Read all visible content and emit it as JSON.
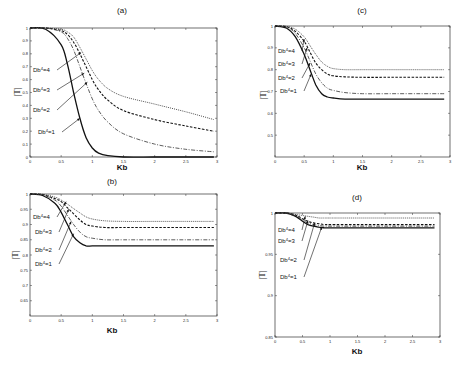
{
  "chart_data": [
    {
      "panel": "(a)",
      "type": "line",
      "title": "(a)",
      "xlabel": "Kb",
      "ylabel": "|T|",
      "xlim": [
        0,
        3
      ],
      "ylim": [
        0,
        1
      ],
      "xticks": [
        "0",
        "0.5",
        "1",
        "1.5",
        "2",
        "2.5",
        "3"
      ],
      "yticks": [
        "0",
        "0.1",
        "0.2",
        "0.3",
        "0.4",
        "0.5",
        "0.6",
        "0.7",
        "0.8",
        "0.9",
        "1"
      ],
      "grid": false,
      "x": [
        0,
        0.25,
        0.5,
        0.6,
        0.7,
        0.8,
        0.9,
        1.0,
        1.1,
        1.25,
        1.5,
        2.0,
        2.5,
        2.95
      ],
      "series": [
        {
          "name": "Db^4=1",
          "style": "solid",
          "values": [
            1,
            0.99,
            0.87,
            0.72,
            0.5,
            0.3,
            0.15,
            0.07,
            0.03,
            0.01,
            0,
            0,
            0,
            0
          ]
        },
        {
          "name": "Db^4=2",
          "style": "dashdot",
          "values": [
            1,
            1,
            0.97,
            0.92,
            0.83,
            0.7,
            0.57,
            0.45,
            0.36,
            0.27,
            0.18,
            0.1,
            0.06,
            0.04
          ]
        },
        {
          "name": "Db^4=3",
          "style": "dashed",
          "values": [
            1,
            1,
            0.98,
            0.95,
            0.89,
            0.8,
            0.7,
            0.6,
            0.52,
            0.44,
            0.36,
            0.29,
            0.24,
            0.2
          ]
        },
        {
          "name": "Db^4=4",
          "style": "dotted",
          "values": [
            1,
            1,
            0.99,
            0.97,
            0.93,
            0.85,
            0.76,
            0.67,
            0.6,
            0.53,
            0.47,
            0.41,
            0.35,
            0.29
          ]
        }
      ],
      "annotations": [
        "Db^4=4",
        "Db^4=3",
        "Db^4=2",
        "Db^4=1"
      ]
    },
    {
      "panel": "(b)",
      "type": "line",
      "title": "(b)",
      "xlabel": "Kb",
      "ylabel": "|T|",
      "xlim": [
        0,
        3
      ],
      "ylim": [
        0.6,
        1
      ],
      "xticks": [
        "0",
        "0.5",
        "1",
        "1.5",
        "2",
        "2.5",
        "3"
      ],
      "yticks": [
        "0.65",
        "0.7",
        "0.75",
        "0.8",
        "0.85",
        "0.9",
        "0.95",
        "1"
      ],
      "grid": false,
      "x": [
        0,
        0.2,
        0.4,
        0.5,
        0.6,
        0.7,
        0.8,
        0.9,
        1.0,
        1.2,
        1.5,
        2.0,
        2.5,
        2.95
      ],
      "series": [
        {
          "name": "Db^4=1",
          "style": "solid",
          "values": [
            1,
            0.995,
            0.97,
            0.94,
            0.9,
            0.86,
            0.84,
            0.83,
            0.83,
            0.83,
            0.83,
            0.83,
            0.83,
            0.83
          ]
        },
        {
          "name": "Db^4=2",
          "style": "dashdot",
          "values": [
            1,
            0.997,
            0.98,
            0.96,
            0.93,
            0.9,
            0.875,
            0.86,
            0.855,
            0.85,
            0.85,
            0.85,
            0.85,
            0.85
          ]
        },
        {
          "name": "Db^4=3",
          "style": "dashed",
          "values": [
            1,
            0.998,
            0.985,
            0.975,
            0.955,
            0.935,
            0.915,
            0.9,
            0.895,
            0.89,
            0.89,
            0.89,
            0.89,
            0.89
          ]
        },
        {
          "name": "Db^4=4",
          "style": "dotted",
          "values": [
            1,
            0.999,
            0.99,
            0.98,
            0.967,
            0.952,
            0.938,
            0.925,
            0.918,
            0.912,
            0.91,
            0.91,
            0.91,
            0.91
          ]
        }
      ],
      "annotations": [
        "Db^4=4",
        "Db^4=3",
        "Db^4=2",
        "Db^4=1"
      ]
    },
    {
      "panel": "(c)",
      "type": "line",
      "title": "(c)",
      "xlabel": "Kb",
      "ylabel": "|T|",
      "xlim": [
        0,
        3
      ],
      "ylim": [
        0.4,
        1
      ],
      "xticks": [
        "0",
        "0.5",
        "1",
        "1.5",
        "2",
        "2.5",
        "3"
      ],
      "yticks": [
        "0.5",
        "0.6",
        "0.7",
        "0.8",
        "0.9",
        "1"
      ],
      "grid": false,
      "x": [
        0,
        0.2,
        0.35,
        0.5,
        0.6,
        0.7,
        0.8,
        0.9,
        1.0,
        1.2,
        1.5,
        2.0,
        2.5,
        2.9
      ],
      "series": [
        {
          "name": "Db^4=1",
          "style": "solid",
          "values": [
            1,
            0.99,
            0.95,
            0.87,
            0.8,
            0.73,
            0.69,
            0.675,
            0.67,
            0.665,
            0.665,
            0.665,
            0.665,
            0.665
          ]
        },
        {
          "name": "Db^4=2",
          "style": "dashdot",
          "values": [
            1,
            0.995,
            0.965,
            0.9,
            0.84,
            0.78,
            0.74,
            0.715,
            0.705,
            0.695,
            0.69,
            0.69,
            0.69,
            0.69
          ]
        },
        {
          "name": "Db^4=3",
          "style": "dashed",
          "values": [
            1,
            0.997,
            0.975,
            0.93,
            0.88,
            0.83,
            0.8,
            0.78,
            0.772,
            0.767,
            0.765,
            0.765,
            0.765,
            0.765
          ]
        },
        {
          "name": "Db^4=4",
          "style": "dotted",
          "values": [
            1,
            0.998,
            0.985,
            0.95,
            0.91,
            0.87,
            0.835,
            0.815,
            0.805,
            0.8,
            0.8,
            0.8,
            0.8,
            0.8
          ]
        }
      ],
      "annotations": [
        "Db^4=4",
        "Db^4=3",
        "Db^4=2",
        "Db^4=1"
      ]
    },
    {
      "panel": "(d)",
      "type": "line",
      "title": "(d)",
      "xlabel": "Kb",
      "ylabel": "|T|",
      "xlim": [
        0,
        3
      ],
      "ylim": [
        0.85,
        1
      ],
      "xticks": [
        "0",
        "0.5",
        "1",
        "1.5",
        "2",
        "2.5",
        "3"
      ],
      "yticks": [
        "0.85",
        "0.9",
        "0.95",
        "1"
      ],
      "grid": false,
      "x": [
        0,
        0.2,
        0.3,
        0.4,
        0.5,
        0.6,
        0.7,
        0.8,
        0.9,
        1.0,
        1.5,
        2.0,
        2.5,
        2.9
      ],
      "series": [
        {
          "name": "Db^4=1",
          "style": "solid",
          "values": [
            1,
            1,
            0.998,
            0.995,
            0.99,
            0.986,
            0.984,
            0.983,
            0.982,
            0.982,
            0.982,
            0.982,
            0.982,
            0.982
          ]
        },
        {
          "name": "Db^4=2",
          "style": "dashdot",
          "values": [
            1,
            1,
            0.998,
            0.996,
            0.991,
            0.988,
            0.986,
            0.985,
            0.984,
            0.984,
            0.984,
            0.984,
            0.984,
            0.984
          ]
        },
        {
          "name": "Db^4=3",
          "style": "dashed",
          "values": [
            1,
            1,
            0.999,
            0.997,
            0.993,
            0.99,
            0.988,
            0.987,
            0.986,
            0.986,
            0.986,
            0.986,
            0.986,
            0.986
          ]
        },
        {
          "name": "Db^4=4",
          "style": "dotted",
          "values": [
            1,
            1,
            0.999,
            0.998,
            0.997,
            0.996,
            0.995,
            0.994,
            0.994,
            0.994,
            0.994,
            0.994,
            0.994,
            0.994
          ]
        }
      ],
      "annotations": [
        "Db^4=4",
        "Db^4=3",
        "Db^4=2",
        "Db^4=1"
      ]
    }
  ],
  "layout": {
    "panels": [
      {
        "id": "a",
        "box": [
          30,
          28,
          217,
          157
        ],
        "title_pos": [
          122,
          13
        ],
        "xlabel_pos": [
          122,
          170
        ],
        "ylabel_pos": [
          20,
          92
        ],
        "ann_pos": [
          [
            33,
            72
          ],
          [
            33,
            92
          ],
          [
            33,
            112
          ],
          [
            38,
            134
          ]
        ],
        "arrow_to": [
          [
            0.82,
            0.81
          ],
          [
            0.87,
            0.65
          ],
          [
            0.92,
            0.58
          ],
          [
            0.8,
            0.3
          ]
        ]
      },
      {
        "id": "c",
        "box": [
          275,
          26,
          450,
          157
        ],
        "title_pos": [
          362,
          13
        ],
        "xlabel_pos": [
          362,
          170
        ],
        "ylabel_pos": [
          266,
          95
        ],
        "ann_pos": [
          [
            278,
            53
          ],
          [
            278,
            66
          ],
          [
            278,
            80
          ],
          [
            280,
            93
          ]
        ],
        "arrow_to": [
          [
            0.5,
            0.94
          ],
          [
            0.55,
            0.9
          ],
          [
            0.6,
            0.83
          ],
          [
            0.62,
            0.78
          ]
        ]
      },
      {
        "id": "b",
        "box": [
          30,
          194,
          217,
          316
        ],
        "title_pos": [
          112,
          184
        ],
        "xlabel_pos": [
          112,
          333
        ],
        "ylabel_pos": [
          18,
          255
        ],
        "ann_pos": [
          [
            33,
            219
          ],
          [
            35,
            234
          ],
          [
            35,
            252
          ],
          [
            35,
            266
          ]
        ],
        "arrow_to": [
          [
            0.58,
            0.975
          ],
          [
            0.62,
            0.95
          ],
          [
            0.66,
            0.91
          ],
          [
            0.7,
            0.87
          ]
        ]
      },
      {
        "id": "d",
        "box": [
          275,
          213,
          440,
          337
        ],
        "title_pos": [
          357,
          200
        ],
        "xlabel_pos": [
          357,
          354
        ],
        "ylabel_pos": [
          265,
          275
        ],
        "ann_pos": [
          [
            278,
            232
          ],
          [
            278,
            243
          ],
          [
            280,
            262
          ],
          [
            280,
            279
          ]
        ],
        "arrow_to": [
          [
            0.55,
            0.996
          ],
          [
            0.6,
            0.991
          ],
          [
            0.72,
            0.988
          ],
          [
            0.85,
            0.983
          ]
        ]
      }
    ],
    "series_styles": {
      "solid": {
        "dash": "",
        "width": 1.3,
        "color": "#111111"
      },
      "dashdot": {
        "dash": "4 1.5 1 1.5",
        "width": 0.8,
        "color": "#333333"
      },
      "dashed": {
        "dash": "2.5 1.5",
        "width": 1.1,
        "color": "#111111"
      },
      "dotted": {
        "dash": "1 1",
        "width": 0.9,
        "color": "#444444"
      }
    }
  }
}
